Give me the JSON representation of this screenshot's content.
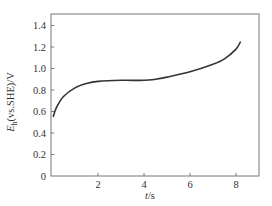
{
  "chart_data": {
    "type": "line",
    "title": "",
    "xlabel": "t/s",
    "ylabel": "E_h(vs.SHE)/V",
    "xlim": [
      0,
      9.0
    ],
    "ylim": [
      0,
      1.5
    ],
    "x_ticks": [
      "2",
      "4",
      "6",
      "8"
    ],
    "y_ticks": [
      "0",
      "0.2",
      "0.4",
      "0.6",
      "0.8",
      "1.0",
      "1.2",
      "1.4"
    ],
    "grid": false,
    "legend": null,
    "series": [
      {
        "name": "E_h",
        "x": [
          0.05,
          0.2,
          0.5,
          1.0,
          1.5,
          2.0,
          3.0,
          4.0,
          4.5,
          5.0,
          6.0,
          7.0,
          7.5,
          8.0,
          8.2
        ],
        "y": [
          0.55,
          0.64,
          0.74,
          0.82,
          0.86,
          0.88,
          0.89,
          0.89,
          0.9,
          0.92,
          0.97,
          1.04,
          1.09,
          1.18,
          1.25
        ]
      }
    ]
  },
  "labels": {
    "xlabel_italic": "t",
    "xlabel_unit": "/s",
    "ylabel_main": "E",
    "ylabel_sub": "h",
    "ylabel_rest": "(vs.SHE)/V"
  }
}
